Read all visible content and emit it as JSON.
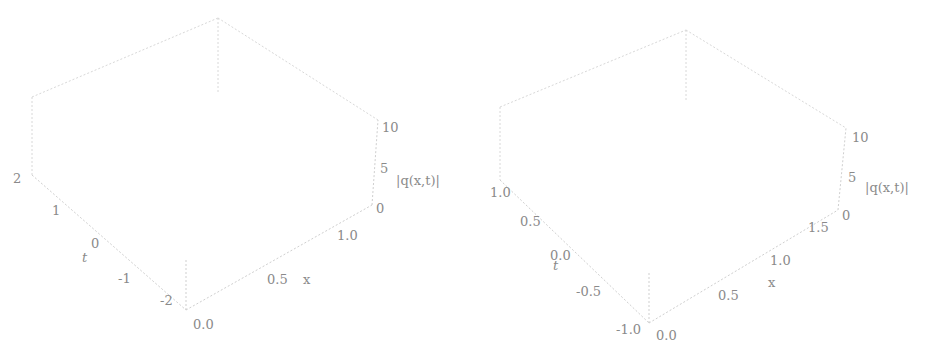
{
  "chart_data": [
    {
      "type": "surface3d",
      "title": "",
      "xlabel": "x",
      "ylabel": "t",
      "zlabel": "|q(x,t)|",
      "x_ticks": [
        "0.0",
        "0.5",
        "1.0"
      ],
      "t_ticks": [
        "-2",
        "-1",
        "0",
        "1",
        "2"
      ],
      "z_ticks": [
        "0",
        "5",
        "10"
      ],
      "xlim": [
        0,
        1.5
      ],
      "tlim": [
        -2,
        2
      ],
      "zlim": [
        0,
        10
      ],
      "description": "Single smooth ridge (kink-like wall) along x=0 for all t, height ~6 at x=0 decaying to ~1 plateau for x>0.5",
      "grid": true
    },
    {
      "type": "surface3d",
      "title": "",
      "xlabel": "x",
      "ylabel": "t",
      "zlabel": "|q(x,t)|",
      "x_ticks": [
        "0.0",
        "0.5",
        "1.0",
        "1.5"
      ],
      "t_ticks": [
        "-1.0",
        "-0.5",
        "0.0",
        "0.5",
        "1.0"
      ],
      "z_ticks": [
        "0",
        "5",
        "10"
      ],
      "xlim": [
        0,
        1.5
      ],
      "tlim": [
        -1,
        1
      ],
      "zlim": [
        0,
        10
      ],
      "description": "Periodic breather-like peaks along x=0 (about 8 oscillations over t in [-1,1]), decaying to ~1 plateau for x>0.5",
      "grid": true
    }
  ],
  "plots": [
    {
      "x_label": "x",
      "t_label": "t",
      "z_label": "|q(x,t)|",
      "x_ticks": [
        "0.0",
        "0.5",
        "1.0"
      ],
      "t_ticks": [
        "2",
        "1",
        "0",
        "-1",
        "-2"
      ],
      "z_ticks": [
        "10",
        "5",
        "0"
      ]
    },
    {
      "x_label": "x",
      "t_label": "t",
      "z_label": "|q(x,t)|",
      "x_ticks": [
        "0.0",
        "0.5",
        "1.0",
        "1.5"
      ],
      "t_ticks": [
        "1.0",
        "0.5",
        "0.0",
        "-0.5",
        "-1.0"
      ],
      "z_ticks": [
        "10",
        "5",
        "0"
      ]
    }
  ],
  "colors": {
    "box": "#d4d4d4",
    "surface_light": "#f2f2f2",
    "surface_dark": "#a8a8a8",
    "mesh": "#7a7a7a",
    "text": "#8a8a8a"
  }
}
